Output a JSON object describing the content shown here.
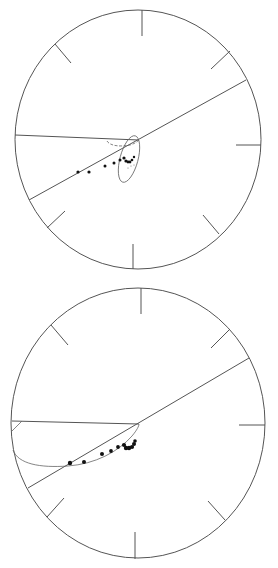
{
  "figure": {
    "type": "equal-area stereonet projections",
    "panels": [
      {
        "id": "top",
        "net": {
          "cx": 138,
          "cy": 139.5,
          "rx": 123,
          "ry": 129.5
        },
        "ticks": [
          {
            "x1": 142,
            "y1": 10,
            "x2": 142,
            "y2": 36
          },
          {
            "x1": 55,
            "y1": 44,
            "x2": 71,
            "y2": 63
          },
          {
            "x1": 230,
            "y1": 51,
            "x2": 211,
            "y2": 69
          },
          {
            "x1": 261,
            "y1": 145,
            "x2": 236,
            "y2": 145
          },
          {
            "x1": 65,
            "y1": 211,
            "x2": 47,
            "y2": 228
          },
          {
            "x1": 203,
            "y1": 215,
            "x2": 219,
            "y2": 234
          },
          {
            "x1": 133,
            "y1": 244,
            "x2": 133,
            "y2": 269
          }
        ],
        "great_circle_lines": [
          {
            "x1": 15,
            "y1": 135,
            "x2": 139,
            "y2": 140
          },
          {
            "x1": 246,
            "y1": 80,
            "x2": 29,
            "y2": 200
          }
        ],
        "confidence_ellipse": {
          "cx": 129,
          "cy": 159,
          "rx": 9,
          "ry": 24,
          "rotate": 15
        },
        "upper_curve": "M 107 141 C 110 146, 120 147, 130 145 C 134 144, 137 142, 139 140",
        "dots": [
          {
            "x": 78,
            "y": 172,
            "r": 1.6
          },
          {
            "x": 89,
            "y": 172,
            "r": 1.6
          },
          {
            "x": 105,
            "y": 166,
            "r": 1.5
          },
          {
            "x": 114,
            "y": 163,
            "r": 1.5
          },
          {
            "x": 120,
            "y": 160,
            "r": 1.5
          },
          {
            "x": 124,
            "y": 158,
            "r": 1.6
          },
          {
            "x": 126,
            "y": 161,
            "r": 1.6
          },
          {
            "x": 128,
            "y": 162,
            "r": 1.4
          },
          {
            "x": 130,
            "y": 162,
            "r": 1.4
          },
          {
            "x": 132,
            "y": 160,
            "r": 1.3
          },
          {
            "x": 134,
            "y": 157,
            "r": 1.2
          }
        ],
        "open_marks": [
          {
            "x": 131,
            "y": 166
          },
          {
            "x": 134,
            "y": 165
          },
          {
            "x": 128,
            "y": 168
          }
        ]
      },
      {
        "id": "bottom",
        "net": {
          "cx": 138,
          "cy": 139,
          "rx": 127,
          "ry": 135
        },
        "ticks": [
          {
            "x1": 141,
            "y1": 4,
            "x2": 141,
            "y2": 30
          },
          {
            "x1": 51,
            "y1": 41,
            "x2": 68,
            "y2": 61
          },
          {
            "x1": 230,
            "y1": 45,
            "x2": 211,
            "y2": 64
          },
          {
            "x1": 265,
            "y1": 141,
            "x2": 239,
            "y2": 141
          },
          {
            "x1": 64,
            "y1": 214,
            "x2": 47,
            "y2": 233
          },
          {
            "x1": 208,
            "y1": 217,
            "x2": 225,
            "y2": 236
          },
          {
            "x1": 135,
            "y1": 248,
            "x2": 135,
            "y2": 275
          }
        ],
        "great_circle_lines": [
          {
            "x1": 12,
            "y1": 137,
            "x2": 139,
            "y2": 140
          },
          {
            "x1": 249,
            "y1": 74,
            "x2": 28,
            "y2": 204
          }
        ],
        "corner_arc": "M 12 147 L 22 137",
        "lower_curve": "M 13 166 C 18 180, 40 184, 68 182 C 95 180, 118 168, 132 152 C 137 146, 139 142, 139 140",
        "dots": [
          {
            "x": 70,
            "y": 179,
            "r": 2.2
          },
          {
            "x": 84,
            "y": 178,
            "r": 2.0
          },
          {
            "x": 102,
            "y": 170,
            "r": 2.0
          },
          {
            "x": 111,
            "y": 167,
            "r": 1.9
          },
          {
            "x": 118,
            "y": 163,
            "r": 1.9
          },
          {
            "x": 124,
            "y": 161,
            "r": 2.1
          },
          {
            "x": 126,
            "y": 164,
            "r": 2.2
          },
          {
            "x": 129,
            "y": 164,
            "r": 2.2
          },
          {
            "x": 132,
            "y": 163,
            "r": 2.1
          },
          {
            "x": 134,
            "y": 160,
            "r": 2.0
          },
          {
            "x": 135,
            "y": 157,
            "r": 1.8
          }
        ]
      }
    ]
  }
}
